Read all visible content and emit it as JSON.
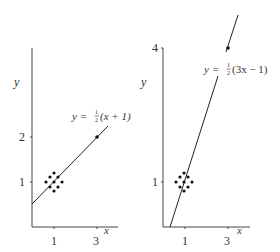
{
  "panels": [
    {
      "id": "left",
      "equation": "y = ½(x + 1)",
      "eq_prefix": "y = ",
      "eq_frac": "1/2",
      "eq_body": "(x + 1)",
      "x_label": "x",
      "y_label": "y",
      "x_ticks": [
        "1",
        "3"
      ],
      "y_ticks": [
        "1",
        "2"
      ],
      "highlight_point": {
        "x": 3,
        "y": 2
      }
    },
    {
      "id": "right",
      "equation": "y = ½(3x − 1)",
      "eq_prefix": "y = ",
      "eq_frac": "1/2",
      "eq_body": "(3x − 1)",
      "x_label": "x",
      "y_label": "y",
      "x_ticks": [
        "1",
        "3"
      ],
      "y_ticks": [
        "1",
        "4"
      ],
      "highlight_point": {
        "x": 3,
        "y": 4
      }
    }
  ],
  "colors": {
    "axis": "#444444",
    "line": "#222222",
    "dots": "#111111",
    "text": "#333333"
  }
}
